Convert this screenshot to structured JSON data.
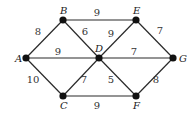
{
  "graph": {
    "nodes": [
      {
        "id": "A",
        "label": "A"
      },
      {
        "id": "B",
        "label": "B"
      },
      {
        "id": "C",
        "label": "C"
      },
      {
        "id": "D",
        "label": "D"
      },
      {
        "id": "E",
        "label": "E"
      },
      {
        "id": "F",
        "label": "F"
      },
      {
        "id": "G",
        "label": "G"
      }
    ],
    "edges": [
      {
        "from": "A",
        "to": "B",
        "weight": "8"
      },
      {
        "from": "B",
        "to": "E",
        "weight": "9"
      },
      {
        "from": "B",
        "to": "D",
        "weight": "6"
      },
      {
        "from": "A",
        "to": "D",
        "weight": "9"
      },
      {
        "from": "D",
        "to": "E",
        "weight": "9"
      },
      {
        "from": "E",
        "to": "G",
        "weight": "7"
      },
      {
        "from": "D",
        "to": "G",
        "weight": "7"
      },
      {
        "from": "A",
        "to": "C",
        "weight": "10"
      },
      {
        "from": "C",
        "to": "D",
        "weight": "7"
      },
      {
        "from": "D",
        "to": "F",
        "weight": "5"
      },
      {
        "from": "C",
        "to": "F",
        "weight": "9"
      },
      {
        "from": "F",
        "to": "G",
        "weight": "8"
      }
    ]
  }
}
